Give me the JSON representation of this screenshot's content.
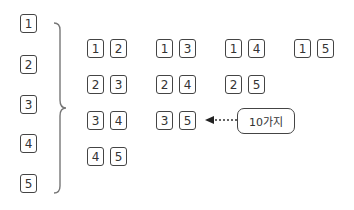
{
  "singles": [
    "1",
    "2",
    "3",
    "4",
    "5"
  ],
  "pairs": [
    [
      "1",
      "2"
    ],
    [
      "1",
      "3"
    ],
    [
      "1",
      "4"
    ],
    [
      "1",
      "5"
    ],
    [
      "2",
      "3"
    ],
    [
      "2",
      "4"
    ],
    [
      "2",
      "5"
    ],
    [
      "3",
      "4"
    ],
    [
      "3",
      "5"
    ],
    [
      "4",
      "5"
    ]
  ],
  "callout": {
    "label": "10가지"
  },
  "colors": {
    "stroke": "#444444",
    "text": "#333333",
    "brace": "#777777"
  }
}
